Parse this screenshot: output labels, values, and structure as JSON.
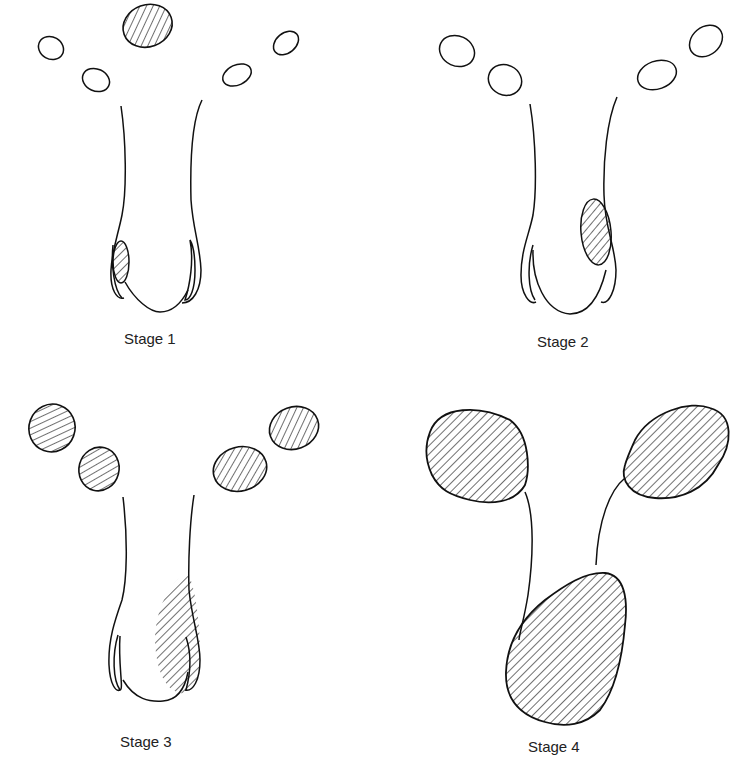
{
  "figure": {
    "stages": [
      {
        "label": "Stage 1",
        "description": "Small hatched lesion at lower left of cervix/uterine lower region; ovaries unshaded"
      },
      {
        "label": "Stage 2",
        "description": "Larger hatched lesion inside lower right of uterus; ovaries unshaded"
      },
      {
        "label": "Stage 3",
        "description": "Hatched region extends across lower right uterus; all four ovarian/adnexal ovals hatched"
      },
      {
        "label": "Stage 4",
        "description": "Large hatched masses: two enlarged upper masses connected by tubes to a large lower mass"
      }
    ],
    "colors": {
      "stroke": "#111111",
      "hatch": "#222222",
      "background": "#ffffff"
    }
  }
}
